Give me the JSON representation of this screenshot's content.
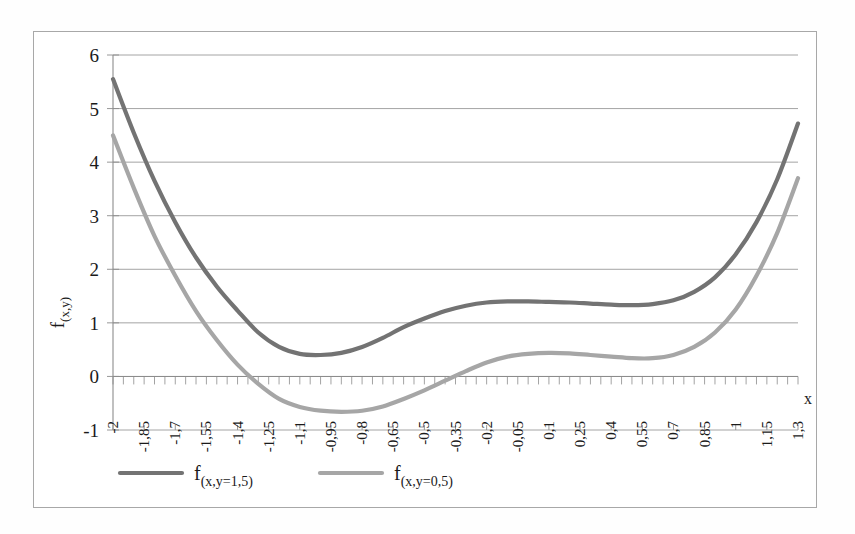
{
  "figure": {
    "background": "#ffffff",
    "frame_color": "#a8a8a8"
  },
  "chart_data": {
    "type": "line",
    "title": "",
    "xlabel": "x",
    "ylabel": "f(x,y)",
    "xlim": [
      -2,
      1.3
    ],
    "ylim": [
      -1,
      6
    ],
    "grid": true,
    "grid_axis": "y",
    "legend_position": "bottom",
    "y_ticks": [
      -1,
      0,
      1,
      2,
      3,
      4,
      5,
      6
    ],
    "y_tick_labels": [
      "-1",
      "0",
      "1",
      "2",
      "3",
      "4",
      "5",
      "6"
    ],
    "x_tick_step": 0.15,
    "x_minor_step": 0.05,
    "x_tick_labels": [
      "-2",
      "-1,85",
      "-1,7",
      "-1,55",
      "-1,4",
      "-1,25",
      "-1,1",
      "-0,95",
      "-0,8",
      "-0,65",
      "-0,5",
      "-0,35",
      "-0,2",
      "-0,05",
      "0,1",
      "0,25",
      "0,4",
      "0,55",
      "0,7",
      "0,85",
      "1",
      "1,15",
      "1,3"
    ],
    "x": [
      -2,
      -1.9,
      -1.8,
      -1.7,
      -1.6,
      -1.5,
      -1.4,
      -1.3,
      -1.2,
      -1.1,
      -1.0,
      -0.9,
      -0.8,
      -0.7,
      -0.6,
      -0.5,
      -0.4,
      -0.3,
      -0.2,
      -0.1,
      0.0,
      0.1,
      0.2,
      0.3,
      0.4,
      0.5,
      0.6,
      0.7,
      0.8,
      0.9,
      1.0,
      1.1,
      1.2,
      1.3
    ],
    "series": [
      {
        "name": "f(x,y=1,5)",
        "name_base": "f",
        "name_sub": "(x,y=1,5)",
        "color": "#737373",
        "width": 4.2,
        "values": [
          5.55,
          4.55,
          3.65,
          2.88,
          2.22,
          1.68,
          1.23,
          0.82,
          0.55,
          0.42,
          0.4,
          0.44,
          0.55,
          0.72,
          0.92,
          1.08,
          1.22,
          1.32,
          1.38,
          1.4,
          1.4,
          1.39,
          1.38,
          1.36,
          1.34,
          1.33,
          1.35,
          1.42,
          1.58,
          1.85,
          2.28,
          2.88,
          3.68,
          4.72
        ]
      },
      {
        "name": "f(x,y=0,5)",
        "name_base": "f",
        "name_sub": "(x,y=0,5)",
        "color": "#a6a6a6",
        "width": 4.2,
        "values": [
          4.5,
          3.52,
          2.62,
          1.88,
          1.22,
          0.68,
          0.22,
          -0.14,
          -0.42,
          -0.57,
          -0.64,
          -0.66,
          -0.64,
          -0.56,
          -0.42,
          -0.26,
          -0.08,
          0.1,
          0.26,
          0.37,
          0.42,
          0.44,
          0.43,
          0.4,
          0.37,
          0.34,
          0.34,
          0.4,
          0.55,
          0.82,
          1.25,
          1.88,
          2.68,
          3.7
        ]
      }
    ]
  },
  "legend": {
    "items": [
      {
        "label_base": "f",
        "label_sub": "(x,y=1,5)",
        "color": "#737373"
      },
      {
        "label_base": "f",
        "label_sub": "(x,y=0,5)",
        "color": "#a6a6a6"
      }
    ]
  }
}
